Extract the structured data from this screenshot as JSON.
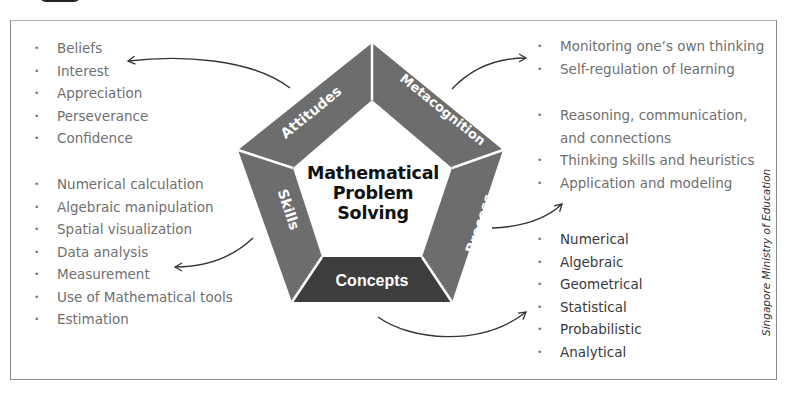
{
  "diagram": {
    "title": "Mathematical Problem Solving",
    "title_lines": [
      "Mathematical",
      "Problem",
      "Solving"
    ],
    "segments": {
      "attitudes": "Attitudes",
      "metacognition": "Metacognition",
      "process": "Process",
      "concepts": "Concepts",
      "skills": "Skills"
    },
    "colors": {
      "band": "#6d6d6d",
      "concepts_band": "#3e3e3e",
      "text": "#6f6f6f",
      "dark_text": "#3a3a3a"
    }
  },
  "attitudes_list": [
    "Beliefs",
    "Interest",
    "Appreciation",
    "Perseverance",
    "Confidence"
  ],
  "skills_list": [
    "Numerical calculation",
    "Algebraic manipulation",
    "Spatial visualization",
    "Data analysis",
    "Measurement",
    "Use of Mathematical tools",
    "Estimation"
  ],
  "metacognition_list": [
    "Monitoring one’s own thinking",
    "Self-regulation of learning"
  ],
  "process_list": [
    "Reasoning, communication,",
    "and connections",
    "Thinking skills and heuristics",
    "Application and modeling"
  ],
  "concepts_list": [
    "Numerical",
    "Algebraic",
    "Geometrical",
    "Statistical",
    "Probabilistic",
    "Analytical"
  ],
  "credit": "Singapore Ministry of Education"
}
